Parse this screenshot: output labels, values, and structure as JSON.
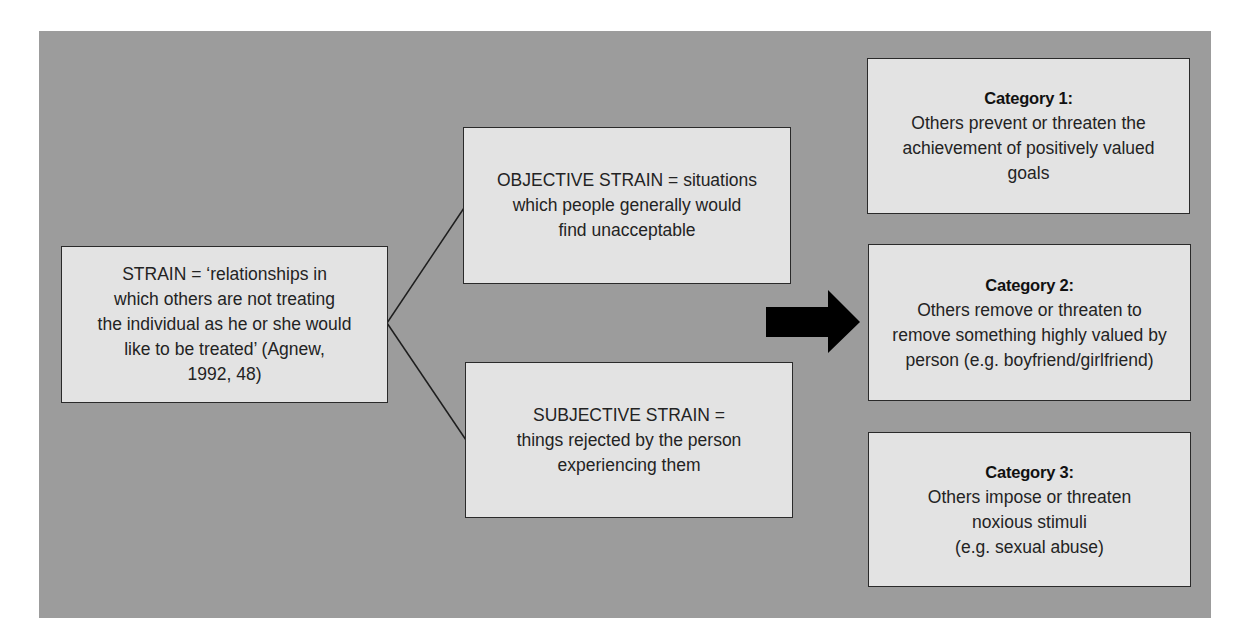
{
  "diagram": {
    "colors": {
      "panel_background": "#9c9c9c",
      "box_fill": "#e3e3e3",
      "box_border": "#2a2a2a",
      "text": "#232323",
      "arrow": "#000000"
    },
    "strain_box": {
      "lines": [
        "STRAIN = ‘relationships in",
        "which others are not treating",
        "the individual as he or she would",
        "like to be treated’ (Agnew,",
        "1992, 48)"
      ]
    },
    "objective_box": {
      "lines": [
        "OBJECTIVE STRAIN = situations",
        "which people generally would",
        "find unacceptable"
      ]
    },
    "subjective_box": {
      "lines": [
        "SUBJECTIVE STRAIN =",
        "things rejected by the person",
        "experiencing them"
      ]
    },
    "arrow": {
      "icon": "right-arrow-icon",
      "direction": "right"
    },
    "categories": [
      {
        "title": "Category 1:",
        "lines": [
          "Others prevent or threaten the",
          "achievement of positively valued",
          "goals"
        ]
      },
      {
        "title": "Category 2:",
        "lines": [
          "Others remove or threaten to",
          "remove something highly valued by",
          "person (e.g. boyfriend/girlfriend)"
        ]
      },
      {
        "title": "Category 3:",
        "lines": [
          "Others impose or threaten",
          "noxious stimuli",
          "(e.g. sexual abuse)"
        ]
      }
    ]
  }
}
